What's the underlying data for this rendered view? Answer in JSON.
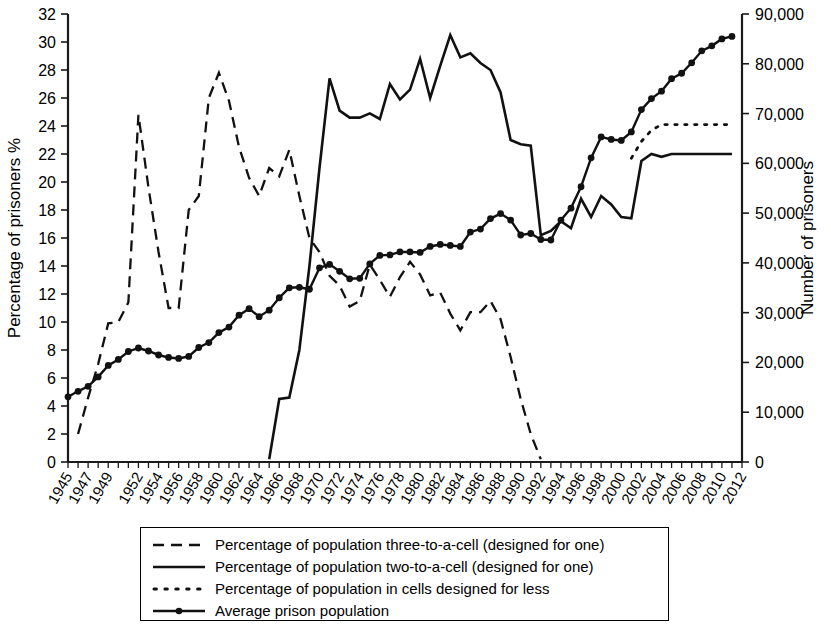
{
  "chart_data": {
    "type": "line",
    "title": "",
    "xlabel": "",
    "ylabel": "Percentage of prisoners %",
    "y2label": "Number of prisoners",
    "xlim": [
      1945,
      2012
    ],
    "ylim": [
      0,
      32
    ],
    "y2lim": [
      0,
      90000
    ],
    "grid": false,
    "legend_position": "bottom",
    "x_tick_labels": [
      "1945",
      "1947",
      "1949",
      "1952",
      "1954",
      "1956",
      "1958",
      "1960",
      "1962",
      "1964",
      "1966",
      "1968",
      "1970",
      "1972",
      "1974",
      "1976",
      "1978",
      "1980",
      "1982",
      "1984",
      "1986",
      "1988",
      "1990",
      "1992",
      "1994",
      "1996",
      "1998",
      "2000",
      "2002",
      "2004",
      "2006",
      "2008",
      "2010",
      "2012"
    ],
    "y_tick_labels": [
      "0",
      "2",
      "4",
      "6",
      "8",
      "10",
      "12",
      "14",
      "16",
      "18",
      "20",
      "22",
      "24",
      "26",
      "28",
      "30",
      "32"
    ],
    "y2_tick_labels": [
      "0",
      "10,000",
      "20,000",
      "30,000",
      "40,000",
      "50,000",
      "60,000",
      "70,000",
      "80,000",
      "90,000"
    ],
    "series": [
      {
        "name": "Percentage of population three-to-a-cell (designed for one)",
        "style": "dashed",
        "axis": "left",
        "x": [
          1946,
          1947,
          1948,
          1949,
          1950,
          1951,
          1952,
          1953,
          1954,
          1955,
          1956,
          1957,
          1958,
          1959,
          1960,
          1961,
          1962,
          1963,
          1964,
          1965,
          1966,
          1967,
          1968,
          1969,
          1970,
          1971,
          1972,
          1973,
          1974,
          1975,
          1976,
          1977,
          1978,
          1979,
          1980,
          1981,
          1982,
          1983,
          1984,
          1985,
          1986,
          1987,
          1988,
          1989,
          1990,
          1991,
          1992
        ],
        "values": [
          2.0,
          4.6,
          7.0,
          9.9,
          10.0,
          11.4,
          24.8,
          19.6,
          15.0,
          11.0,
          11.0,
          18.0,
          19.0,
          26.0,
          27.8,
          25.8,
          22.5,
          20.3,
          19.0,
          21.0,
          20.4,
          22.3,
          19.0,
          16.0,
          15.0,
          13.3,
          12.6,
          11.1,
          11.5,
          14.1,
          13.0,
          11.8,
          13.2,
          14.3,
          13.4,
          11.9,
          12.1,
          10.6,
          9.4,
          10.7,
          10.7,
          11.5,
          10.2,
          7.5,
          4.5,
          2.0,
          0.2
        ]
      },
      {
        "name": "Percentage of population two-to-a-cell (designed for one)",
        "style": "solid",
        "axis": "left",
        "x": [
          1965,
          1966,
          1967,
          1968,
          1969,
          1970,
          1971,
          1972,
          1973,
          1974,
          1975,
          1976,
          1977,
          1978,
          1979,
          1980,
          1981,
          1982,
          1983,
          1984,
          1985,
          1986,
          1987,
          1988,
          1989,
          1990,
          1991,
          1992,
          1993,
          1994,
          1995,
          1996,
          1997,
          1998,
          1999,
          2000,
          2001,
          2002,
          2003,
          2004,
          2005,
          2006,
          2007,
          2008,
          2009,
          2010,
          2011
        ],
        "values": [
          0.2,
          4.5,
          4.6,
          8.0,
          14.0,
          21.0,
          27.4,
          25.1,
          24.6,
          24.6,
          24.9,
          24.5,
          27.0,
          25.9,
          26.6,
          28.8,
          26.0,
          28.3,
          30.5,
          28.9,
          29.2,
          28.5,
          28.0,
          26.4,
          23.0,
          22.7,
          22.6,
          16.2,
          16.5,
          17.2,
          16.7,
          18.8,
          17.5,
          19.0,
          18.4,
          17.5,
          17.4,
          21.5,
          22.0,
          21.8,
          22.0,
          22.0,
          22.0,
          22.0,
          22.0,
          22.0,
          22.0
        ]
      },
      {
        "name": "Percentage of population in cells designed for less",
        "style": "dotted",
        "axis": "left",
        "x": [
          2001,
          2002,
          2003,
          2004,
          2005,
          2006,
          2007,
          2008,
          2009,
          2010,
          2011
        ],
        "values": [
          21.7,
          22.9,
          23.7,
          24.1,
          24.1,
          24.1,
          24.1,
          24.1,
          24.1,
          24.1,
          24.1
        ]
      },
      {
        "name": "Average prison population",
        "style": "solid-markers",
        "axis": "right",
        "x": [
          1945,
          1946,
          1947,
          1948,
          1949,
          1950,
          1951,
          1952,
          1953,
          1954,
          1955,
          1956,
          1957,
          1958,
          1959,
          1960,
          1961,
          1962,
          1963,
          1964,
          1965,
          1966,
          1967,
          1968,
          1969,
          1970,
          1971,
          1972,
          1973,
          1974,
          1975,
          1976,
          1977,
          1978,
          1979,
          1980,
          1981,
          1982,
          1983,
          1984,
          1985,
          1986,
          1987,
          1988,
          1989,
          1990,
          1991,
          1992,
          1993,
          1994,
          1995,
          1996,
          1997,
          1998,
          1999,
          2000,
          2001,
          2002,
          2003,
          2004,
          2005,
          2006,
          2007,
          2008,
          2009,
          2010,
          2011
        ],
        "values": [
          13100,
          14200,
          15200,
          17100,
          19400,
          20600,
          22200,
          22900,
          22300,
          21500,
          21000,
          20800,
          21200,
          23000,
          24000,
          26000,
          27100,
          29500,
          30800,
          29200,
          30500,
          33000,
          35000,
          35100,
          34700,
          39000,
          39700,
          38300,
          36800,
          36900,
          39800,
          41500,
          41600,
          42200,
          42200,
          42100,
          43300,
          43700,
          43500,
          43300,
          46200,
          46800,
          48900,
          49900,
          48600,
          45600,
          45900,
          44700,
          44600,
          48600,
          51000,
          55300,
          61100,
          65300,
          64800,
          64600,
          66300,
          70800,
          73000,
          74500,
          77000,
          78100,
          80200,
          82600,
          83600,
          85000,
          85500
        ]
      }
    ]
  },
  "legend": {
    "items": [
      {
        "label": "Percentage of population three-to-a-cell (designed for one)",
        "style": "dashed"
      },
      {
        "label": "Percentage of population two-to-a-cell (designed for one)",
        "style": "solid"
      },
      {
        "label": "Percentage of population in cells designed for less",
        "style": "dotted"
      },
      {
        "label": "Average prison population",
        "style": "solid-markers"
      }
    ]
  },
  "colors": {
    "line": "#111111",
    "axis": "#1a1a1a",
    "background": "#ffffff"
  }
}
